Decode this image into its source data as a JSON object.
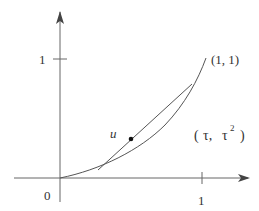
{
  "diagram": {
    "type": "function-plot",
    "x_axis": {
      "tick_label": "1",
      "origin_label": "0"
    },
    "y_axis": {
      "tick_label": "1"
    },
    "curve": {
      "description": "convex curve from origin to (1,1)",
      "endpoint_label": "(1, 1)"
    },
    "chord": {
      "description": "secant line between two points on the curve"
    },
    "point": {
      "label": "u"
    },
    "curve_point_label_parts": {
      "open": "(",
      "tau1": "τ,",
      "tau2": "τ",
      "exp": "2",
      "close": ")"
    },
    "colors": {
      "stroke": "#555555",
      "text": "#333333",
      "background": "#ffffff"
    }
  }
}
